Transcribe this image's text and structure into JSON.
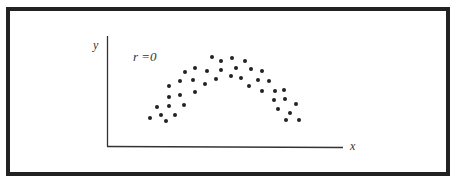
{
  "chart_data": {
    "type": "scatter",
    "title": "",
    "annotation": "r =0",
    "xlabel": "x",
    "ylabel": "y",
    "grid": false,
    "legend": null,
    "axis_ticks": false,
    "point_color": "#222222",
    "frame_color": "#222222",
    "points_px": [
      [
        150,
        118
      ],
      [
        157,
        107
      ],
      [
        161,
        115
      ],
      [
        166,
        121
      ],
      [
        169,
        86
      ],
      [
        169,
        97
      ],
      [
        169,
        106
      ],
      [
        175,
        115
      ],
      [
        180,
        81
      ],
      [
        180,
        95
      ],
      [
        184,
        105
      ],
      [
        185,
        72
      ],
      [
        193,
        80
      ],
      [
        195,
        68
      ],
      [
        195,
        92
      ],
      [
        205,
        84
      ],
      [
        207,
        71
      ],
      [
        212,
        57
      ],
      [
        216,
        79
      ],
      [
        221,
        61
      ],
      [
        221,
        70
      ],
      [
        231,
        76
      ],
      [
        232,
        58
      ],
      [
        236,
        68
      ],
      [
        241,
        78
      ],
      [
        245,
        61
      ],
      [
        251,
        69
      ],
      [
        249,
        86
      ],
      [
        262,
        71
      ],
      [
        258,
        80
      ],
      [
        262,
        91
      ],
      [
        269,
        81
      ],
      [
        275,
        91
      ],
      [
        274,
        100
      ],
      [
        278,
        109
      ],
      [
        284,
        90
      ],
      [
        285,
        99
      ],
      [
        286,
        120
      ],
      [
        290,
        113
      ],
      [
        296,
        104
      ],
      [
        299,
        120
      ]
    ]
  },
  "labels": {
    "y_axis": "y",
    "x_axis": "x",
    "correlation": "r =0"
  }
}
